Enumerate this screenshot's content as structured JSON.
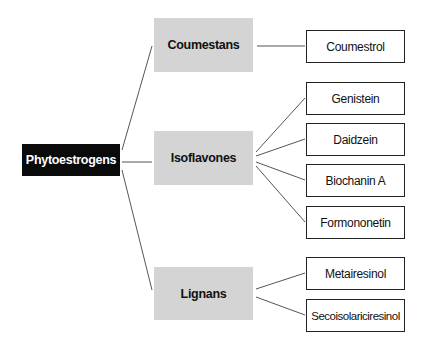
{
  "diagram": {
    "title": "Phytoestrogens",
    "root": {
      "label": "Phytoestrogens",
      "color": "#0a0a0a"
    },
    "categories": [
      {
        "label": "Coumestans",
        "children": [
          "Coumestrol"
        ]
      },
      {
        "label": "Isoflavones",
        "children": [
          "Genistein",
          "Daidzein",
          "Biochanin A",
          "Formononetin"
        ]
      },
      {
        "label": "Lignans",
        "children": [
          "Metairesinol",
          "Secoisolariciresinol"
        ]
      }
    ],
    "category_fill": "#d4d4d4",
    "connector_color": "#555555"
  }
}
